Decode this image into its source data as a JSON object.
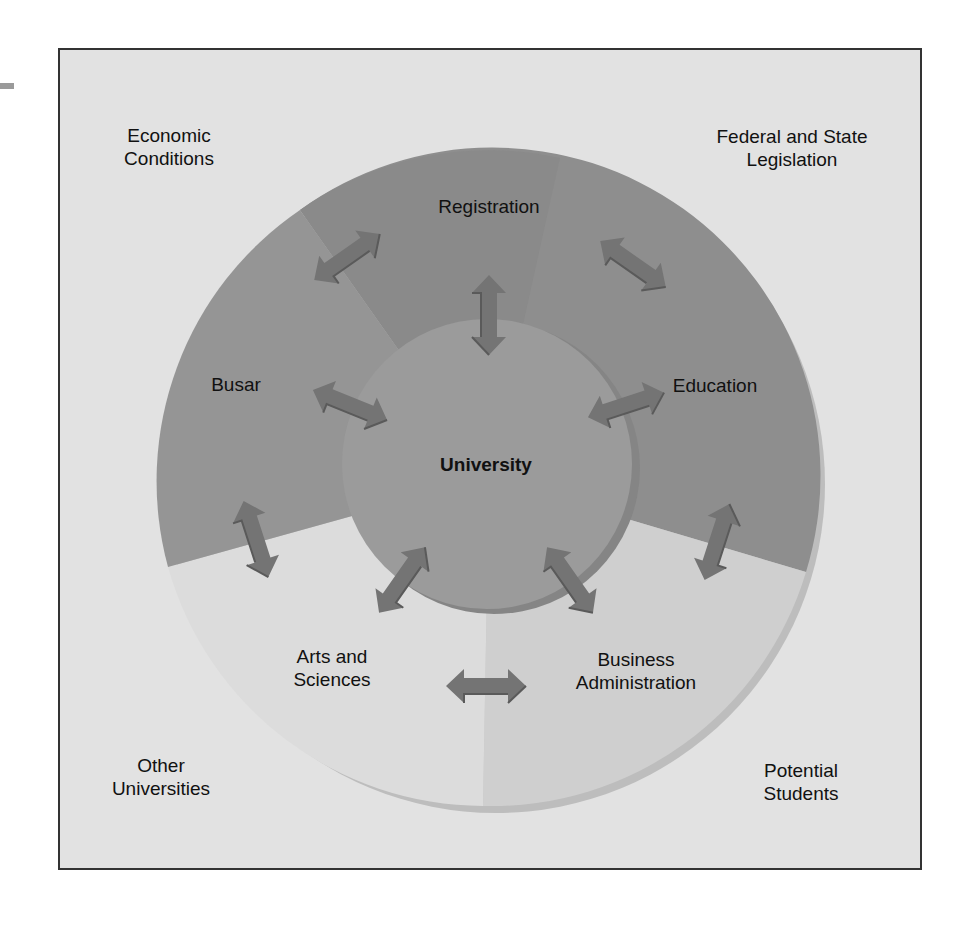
{
  "diagram": {
    "type": "concentric-system-diagram",
    "title": "",
    "center": {
      "label": "University"
    },
    "inner_segments": [
      {
        "id": "registration",
        "label": "Registration",
        "color": "#8c8c8c"
      },
      {
        "id": "education",
        "label": "Education",
        "color": "#909090"
      },
      {
        "id": "business-administration",
        "label_lines": [
          "Business",
          "Administration"
        ],
        "color": "#cfcfcf"
      },
      {
        "id": "arts-and-sciences",
        "label_lines": [
          "Arts and",
          "Sciences"
        ],
        "color": "#dcdcdc"
      },
      {
        "id": "busar",
        "label": "Busar",
        "color": "#959595"
      }
    ],
    "environment": [
      {
        "id": "economic-conditions",
        "label_lines": [
          "Economic",
          "Conditions"
        ]
      },
      {
        "id": "federal-state-legislation",
        "label_lines": [
          "Federal and State",
          "Legislation"
        ]
      },
      {
        "id": "other-universities",
        "label_lines": [
          "Other",
          "Universities"
        ]
      },
      {
        "id": "potential-students",
        "label_lines": [
          "Potential",
          "Students"
        ]
      }
    ],
    "arrows": {
      "count": 11,
      "meaning": "two-way interaction",
      "color": "#747474"
    },
    "colors": {
      "background": "#e2e2e2",
      "frame_border": "#333333",
      "inner_circle": "#9b9b9b",
      "ring_shadow": "#bcbcbc"
    }
  }
}
